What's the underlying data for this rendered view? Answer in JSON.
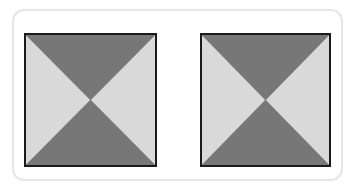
{
  "figure": {
    "shapes": [
      {
        "name": "left-square",
        "x": 24,
        "y": 33,
        "size": 133
      },
      {
        "name": "right-square",
        "x": 200,
        "y": 33,
        "size": 130
      }
    ],
    "colors": {
      "dark": "#777777",
      "light": "#d9d9d9",
      "border": "#1a1a1a",
      "card_border": "#e6e6e6"
    }
  }
}
